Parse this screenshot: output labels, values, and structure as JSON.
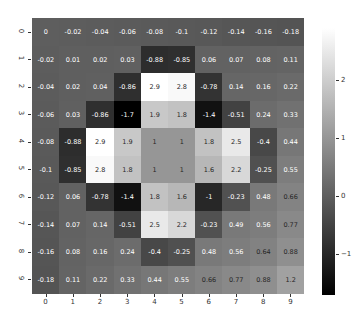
{
  "chart_data": {
    "type": "heatmap",
    "title": "",
    "xlabel": "",
    "ylabel": "",
    "x_tick_labels": [
      "0",
      "1",
      "2",
      "3",
      "4",
      "5",
      "6",
      "7",
      "8",
      "9"
    ],
    "y_tick_labels": [
      "0",
      "1",
      "2",
      "3",
      "4",
      "5",
      "6",
      "7",
      "8",
      "9"
    ],
    "values": [
      [
        0,
        -0.02,
        -0.04,
        -0.06,
        -0.08,
        -0.1,
        -0.12,
        -0.14,
        -0.16,
        -0.18
      ],
      [
        -0.02,
        0.01,
        0.02,
        0.03,
        -0.88,
        -0.85,
        0.06,
        0.07,
        0.08,
        0.11
      ],
      [
        -0.04,
        0.02,
        0.04,
        -0.86,
        2.9,
        2.8,
        -0.78,
        0.14,
        0.16,
        0.22
      ],
      [
        -0.06,
        0.03,
        -0.86,
        -1.7,
        1.9,
        1.8,
        -1.4,
        -0.51,
        0.24,
        0.33
      ],
      [
        -0.08,
        -0.88,
        2.9,
        1.9,
        1,
        1,
        1.8,
        2.5,
        -0.4,
        0.44
      ],
      [
        -0.1,
        -0.85,
        2.8,
        1.8,
        1,
        1,
        1.6,
        2.2,
        -0.25,
        0.55
      ],
      [
        -0.12,
        0.06,
        -0.78,
        -1.4,
        1.8,
        1.6,
        -1,
        -0.23,
        0.48,
        0.66
      ],
      [
        -0.14,
        0.07,
        0.14,
        -0.51,
        2.5,
        2.2,
        -0.23,
        0.49,
        0.56,
        0.77
      ],
      [
        -0.16,
        0.08,
        0.16,
        0.24,
        -0.4,
        -0.25,
        0.48,
        0.56,
        0.64,
        0.88
      ],
      [
        -0.18,
        0.11,
        0.22,
        0.33,
        0.44,
        0.55,
        0.66,
        0.77,
        0.88,
        1.2
      ]
    ],
    "annotated": true,
    "colormap": "gray",
    "colorbar": {
      "ticks": [
        2,
        1,
        0,
        -1
      ],
      "tick_labels": [
        "2",
        "1",
        "0",
        "−1"
      ],
      "vmin": -1.7,
      "vmax": 2.9
    },
    "grid": false
  }
}
